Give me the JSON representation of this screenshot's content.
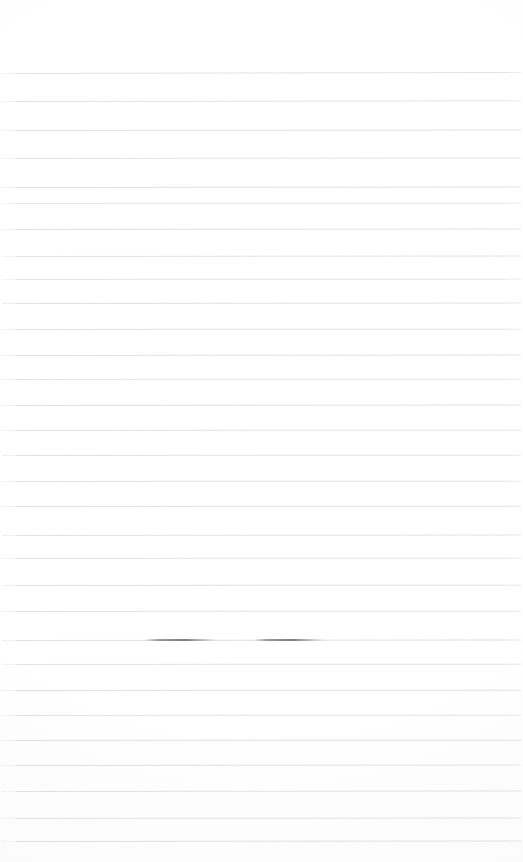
{
  "document": {
    "kind": "lined-paper-scan",
    "title": "Blank ruled notebook page",
    "background_color": "#ffffff",
    "page_width": 523,
    "page_height": 862,
    "written_text": "",
    "caption": ""
  },
  "ruling": {
    "line_color": "#dcdcdc",
    "line_color_dark": "#c9cacd",
    "line_thickness_px": 1,
    "line_count": 31,
    "first_line_y": 73,
    "last_line_y": 841,
    "average_spacing_px": 25.6,
    "left_inset_px": 2,
    "right_inset_px": 2,
    "top_margin_px": 72,
    "bottom_margin_px": 21,
    "lines": [
      {
        "y": 73,
        "opacity": 0.85,
        "slant": -0.1
      },
      {
        "y": 101,
        "opacity": 0.8,
        "slant": -0.08
      },
      {
        "y": 130,
        "opacity": 0.85,
        "slant": -0.06
      },
      {
        "y": 158,
        "opacity": 0.78,
        "slant": -0.05
      },
      {
        "y": 187,
        "opacity": 0.88,
        "slant": -0.06
      },
      {
        "y": 203,
        "opacity": 0.7,
        "slant": -0.04
      },
      {
        "y": 229,
        "opacity": 0.86,
        "slant": -0.05
      },
      {
        "y": 256,
        "opacity": 0.8,
        "slant": -0.05
      },
      {
        "y": 279,
        "opacity": 0.74,
        "slant": -0.04
      },
      {
        "y": 303,
        "opacity": 0.88,
        "slant": -0.05
      },
      {
        "y": 329,
        "opacity": 0.82,
        "slant": -0.04
      },
      {
        "y": 355,
        "opacity": 0.86,
        "slant": -0.05
      },
      {
        "y": 379,
        "opacity": 0.78,
        "slant": -0.04
      },
      {
        "y": 405,
        "opacity": 0.88,
        "slant": -0.05
      },
      {
        "y": 430,
        "opacity": 0.84,
        "slant": -0.04
      },
      {
        "y": 455,
        "opacity": 0.86,
        "slant": -0.04
      },
      {
        "y": 481,
        "opacity": 0.82,
        "slant": -0.04
      },
      {
        "y": 506,
        "opacity": 0.88,
        "slant": -0.04
      },
      {
        "y": 535,
        "opacity": 0.84,
        "slant": -0.05
      },
      {
        "y": 558,
        "opacity": 0.8,
        "slant": -0.04
      },
      {
        "y": 585,
        "opacity": 0.88,
        "slant": -0.04
      },
      {
        "y": 611,
        "opacity": 0.84,
        "slant": -0.04
      },
      {
        "y": 640,
        "opacity": 0.9,
        "slant": -0.05
      },
      {
        "y": 664,
        "opacity": 0.82,
        "slant": -0.04
      },
      {
        "y": 690,
        "opacity": 0.88,
        "slant": -0.04
      },
      {
        "y": 715,
        "opacity": 0.84,
        "slant": -0.04
      },
      {
        "y": 740,
        "opacity": 0.88,
        "slant": -0.04
      },
      {
        "y": 765,
        "opacity": 0.86,
        "slant": -0.05
      },
      {
        "y": 791,
        "opacity": 0.88,
        "slant": -0.05
      },
      {
        "y": 818,
        "opacity": 0.86,
        "slant": -0.05
      },
      {
        "y": 841,
        "opacity": 0.92,
        "slant": -0.06
      }
    ]
  },
  "marks": {
    "description": "Two darker overstrike segments on the rule at y=640",
    "items": [
      {
        "x": 145,
        "y": 639,
        "width": 72
      },
      {
        "x": 254,
        "y": 639,
        "width": 70
      }
    ]
  }
}
